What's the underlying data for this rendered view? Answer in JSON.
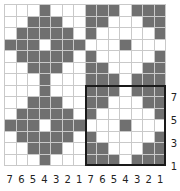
{
  "colors": {
    "dark": "#707070",
    "light": "#ffffff",
    "gridline": "#c9c9c9",
    "frame": "#1a1a1a"
  },
  "grid": {
    "rows": 14,
    "cols": 14,
    "cells": [
      [
        0,
        0,
        0,
        1,
        0,
        0,
        0,
        1,
        1,
        1,
        0,
        1,
        1,
        1
      ],
      [
        0,
        0,
        1,
        1,
        1,
        0,
        0,
        1,
        1,
        0,
        0,
        0,
        1,
        1
      ],
      [
        0,
        1,
        1,
        1,
        1,
        1,
        0,
        1,
        0,
        0,
        0,
        0,
        0,
        1
      ],
      [
        1,
        1,
        1,
        0,
        1,
        1,
        1,
        0,
        0,
        0,
        1,
        0,
        0,
        0
      ],
      [
        0,
        1,
        1,
        1,
        1,
        1,
        0,
        1,
        0,
        0,
        0,
        0,
        0,
        1
      ],
      [
        0,
        0,
        1,
        1,
        1,
        0,
        0,
        1,
        1,
        0,
        0,
        0,
        1,
        1
      ],
      [
        0,
        0,
        0,
        1,
        0,
        0,
        0,
        1,
        1,
        1,
        0,
        1,
        1,
        1
      ],
      [
        0,
        0,
        0,
        1,
        0,
        0,
        0,
        1,
        1,
        1,
        0,
        1,
        1,
        1
      ],
      [
        0,
        0,
        1,
        1,
        1,
        0,
        0,
        1,
        1,
        0,
        0,
        0,
        1,
        1
      ],
      [
        0,
        1,
        1,
        1,
        1,
        1,
        0,
        1,
        0,
        0,
        0,
        0,
        0,
        1
      ],
      [
        1,
        1,
        1,
        0,
        1,
        1,
        1,
        0,
        0,
        0,
        1,
        0,
        0,
        0
      ],
      [
        0,
        1,
        1,
        1,
        1,
        1,
        0,
        1,
        0,
        0,
        0,
        0,
        0,
        1
      ],
      [
        0,
        0,
        1,
        1,
        1,
        0,
        0,
        1,
        1,
        0,
        0,
        0,
        1,
        1
      ],
      [
        0,
        0,
        0,
        1,
        0,
        0,
        0,
        1,
        1,
        1,
        0,
        1,
        1,
        1
      ]
    ],
    "highlight_frame": {
      "row_start": 7,
      "col_start": 7,
      "size": 7
    }
  },
  "column_labels": [
    "7",
    "6",
    "5",
    "4",
    "3",
    "2",
    "1",
    "7",
    "6",
    "5",
    "4",
    "3",
    "2",
    "1"
  ],
  "row_labels": [
    {
      "text": "7",
      "y": 92
    },
    {
      "text": "5",
      "y": 115
    },
    {
      "text": "3",
      "y": 138
    },
    {
      "text": "1",
      "y": 161
    }
  ]
}
